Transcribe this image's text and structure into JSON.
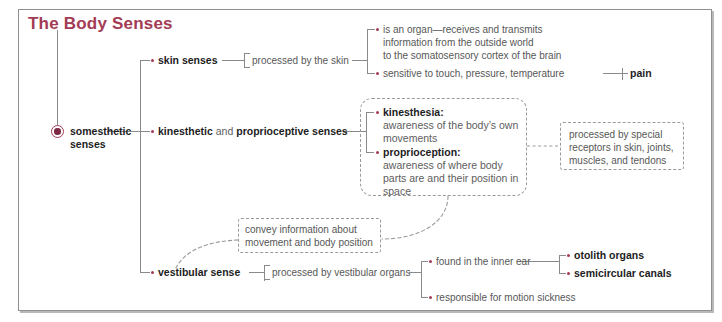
{
  "diagram": {
    "title": "The Body Senses",
    "title_color": "#a33b55",
    "accent_color": "#a33b55",
    "frame_border_color": "#8f8f8f",
    "root": {
      "label_line1": "somesthetic",
      "label_line2": "senses",
      "marker": "filled-circle-node"
    },
    "branches": [
      {
        "id": "skin",
        "label": "skin senses",
        "connector_label": "processed by the skin",
        "details": [
          {
            "id": "skin-organ",
            "lines": [
              "is an organ—receives and transmits",
              "information from the outside world",
              "to the somatosensory cortex of the brain"
            ]
          },
          {
            "id": "skin-sensitive",
            "lines": [
              "sensitive to touch, pressure, temperature"
            ],
            "sub": {
              "id": "pain",
              "label": "pain"
            }
          }
        ]
      },
      {
        "id": "kinesthetic",
        "label_bold1": "kinesthetic",
        "label_plain": " and ",
        "label_bold2": "proprioceptive senses",
        "box": {
          "id": "kinesthesia-proprioception-box",
          "items": [
            {
              "term": "kinesthesia:",
              "lines": [
                "awareness of the body’s own",
                "movements"
              ]
            },
            {
              "term": "proprioception:",
              "lines": [
                "awareness of where body",
                "parts are and their position in",
                "space"
              ]
            }
          ]
        },
        "side_box": {
          "id": "receptors-box",
          "lines": [
            "processed by special",
            "receptors in skin, joints,",
            "muscles, and tendons"
          ]
        },
        "lower_box": {
          "id": "convey-info-box",
          "lines": [
            "convey information about",
            "movement and body position"
          ]
        }
      },
      {
        "id": "vestibular",
        "label": "vestibular sense",
        "connector_label": "processed by vestibular organs",
        "details": [
          {
            "id": "inner-ear",
            "lines": [
              "found in the inner ear"
            ],
            "subs": [
              {
                "id": "otolith-organs",
                "label": "otolith organs"
              },
              {
                "id": "semicircular-canals",
                "label": "semicircular canals"
              }
            ]
          },
          {
            "id": "motion-sickness",
            "lines": [
              "responsible for motion sickness"
            ]
          }
        ]
      }
    ]
  }
}
